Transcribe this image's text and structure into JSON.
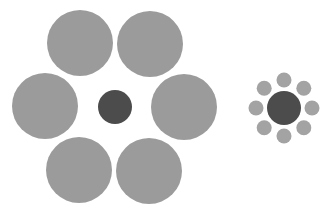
{
  "figure": {
    "background": "#ffffff",
    "colors": {
      "large_surround": "#9b9b9b",
      "small_surround": "#a3a3a3",
      "target": "#4c4c4c"
    },
    "left_cluster": {
      "target": {
        "cx": 115,
        "cy": 107,
        "r": 17
      },
      "surround_radius": 33,
      "surrounds": [
        {
          "cx": 80,
          "cy": 43
        },
        {
          "cx": 150,
          "cy": 44
        },
        {
          "cx": 45,
          "cy": 106
        },
        {
          "cx": 184,
          "cy": 107
        },
        {
          "cx": 79,
          "cy": 170
        },
        {
          "cx": 149,
          "cy": 171
        }
      ]
    },
    "right_cluster": {
      "target": {
        "cx": 284,
        "cy": 108,
        "r": 17
      },
      "surround_radius": 7.5,
      "ring_radius": 28,
      "surround_count": 8
    }
  }
}
